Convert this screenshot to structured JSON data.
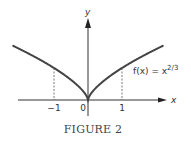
{
  "chart_data": {
    "type": "line",
    "title": "",
    "caption": "FIGURE 2",
    "xlabel": "x",
    "ylabel": "y",
    "series": [
      {
        "name": "f(x) = x^(2/3)",
        "label_parts": {
          "lhs": "f(x) = x",
          "exponent": "2/3"
        },
        "x": [
          -2.2,
          -2.0,
          -1.5,
          -1.0,
          -0.5,
          -0.25,
          -0.1,
          0,
          0.1,
          0.25,
          0.5,
          1.0,
          1.5,
          2.0,
          2.2
        ],
        "y": [
          1.69,
          1.587,
          1.31,
          1.0,
          0.63,
          0.397,
          0.215,
          0,
          0.215,
          0.397,
          0.63,
          1.0,
          1.31,
          1.587,
          1.69
        ]
      }
    ],
    "x_ticks": [
      {
        "value": -1,
        "label": "−1"
      },
      {
        "value": 0,
        "label": "0"
      },
      {
        "value": 1,
        "label": "1"
      }
    ],
    "reference_lines": [
      {
        "x": -1,
        "y": 1,
        "style": "dashed"
      },
      {
        "x": 1,
        "y": 1,
        "style": "dashed"
      }
    ],
    "xlim": [
      -2.2,
      2.3
    ],
    "ylim": [
      -0.5,
      2.5
    ],
    "grid": false,
    "legend": "none",
    "colors": {
      "curve": "#444444",
      "axes": "#333333",
      "dashed": "#555555"
    }
  }
}
